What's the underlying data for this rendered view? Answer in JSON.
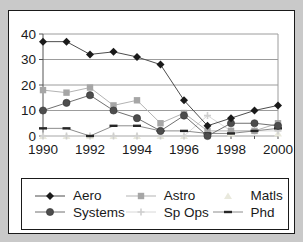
{
  "chart_data": {
    "type": "line",
    "x": [
      1990,
      1991,
      1992,
      1993,
      1994,
      1995,
      1996,
      1997,
      1998,
      1999,
      2000
    ],
    "x_tick_labels": [
      "1990",
      "1992",
      "1994",
      "1996",
      "1998",
      "2000"
    ],
    "y_ticks": [
      0,
      10,
      20,
      30,
      40
    ],
    "ylim": [
      0,
      40
    ],
    "grid": "horizontal",
    "legend_position": "bottom",
    "title": "",
    "xlabel": "",
    "ylabel": "",
    "series": [
      {
        "name": "Aero",
        "marker": "diamond",
        "color": "#1a1a1a",
        "line_color": "#4d4d4d",
        "values": [
          37,
          37,
          32,
          33,
          31,
          28,
          14,
          4,
          7,
          10,
          12
        ]
      },
      {
        "name": "Astro",
        "marker": "square",
        "color": "#a6a6a6",
        "line_color": "#b3b3b3",
        "values": [
          18,
          17,
          19,
          12,
          14,
          5,
          9,
          2,
          2,
          2,
          5
        ]
      },
      {
        "name": "Matls",
        "marker": "triangle",
        "color": "#e9e9dd",
        "line_color": "#ececе2",
        "values": [
          0,
          0,
          0,
          0,
          0,
          0,
          0,
          2,
          1,
          2,
          1
        ]
      },
      {
        "name": "Systems",
        "marker": "circle",
        "color": "#4d4d4d",
        "line_color": "#707070",
        "values": [
          10,
          13,
          16,
          10,
          7,
          2,
          8,
          0,
          5,
          5,
          4
        ]
      },
      {
        "name": "Sp Ops",
        "marker": "plus",
        "color": "#cfcfcf",
        "line_color": "#d8d8d8",
        "values": [
          0,
          0,
          0,
          0,
          0,
          0,
          0,
          8,
          2,
          2,
          2
        ]
      },
      {
        "name": "Phd",
        "marker": "dash",
        "color": "#262626",
        "line_color": "#8c8c8c",
        "values": [
          3,
          3,
          0,
          4,
          4,
          2,
          2,
          1,
          1,
          2,
          3
        ]
      }
    ]
  }
}
